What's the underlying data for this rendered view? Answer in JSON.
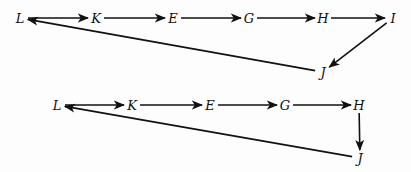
{
  "diagrams": [
    {
      "name": "top-graph",
      "nodes": [
        {
          "id": "L",
          "label": "L",
          "x": 20,
          "y": 18
        },
        {
          "id": "K",
          "label": "K",
          "x": 96,
          "y": 18
        },
        {
          "id": "E",
          "label": "E",
          "x": 173,
          "y": 18
        },
        {
          "id": "G",
          "label": "G",
          "x": 249,
          "y": 18
        },
        {
          "id": "H",
          "label": "H",
          "x": 323,
          "y": 18
        },
        {
          "id": "I",
          "label": "I",
          "x": 393,
          "y": 18
        },
        {
          "id": "J",
          "label": "J",
          "x": 323,
          "y": 72
        }
      ],
      "edges": [
        [
          "L",
          "K"
        ],
        [
          "K",
          "E"
        ],
        [
          "E",
          "G"
        ],
        [
          "G",
          "H"
        ],
        [
          "H",
          "I"
        ],
        [
          "I",
          "J"
        ],
        [
          "J",
          "L"
        ]
      ]
    },
    {
      "name": "bottom-graph",
      "nodes": [
        {
          "id": "L",
          "label": "L",
          "x": 57,
          "y": 105
        },
        {
          "id": "K",
          "label": "K",
          "x": 132,
          "y": 105
        },
        {
          "id": "E",
          "label": "E",
          "x": 210,
          "y": 105
        },
        {
          "id": "G",
          "label": "G",
          "x": 285,
          "y": 105
        },
        {
          "id": "H",
          "label": "H",
          "x": 359,
          "y": 105
        },
        {
          "id": "J",
          "label": "J",
          "x": 360,
          "y": 158
        }
      ],
      "edges": [
        [
          "L",
          "K"
        ],
        [
          "K",
          "E"
        ],
        [
          "E",
          "G"
        ],
        [
          "G",
          "H"
        ],
        [
          "H",
          "J"
        ],
        [
          "J",
          "L"
        ]
      ]
    }
  ]
}
